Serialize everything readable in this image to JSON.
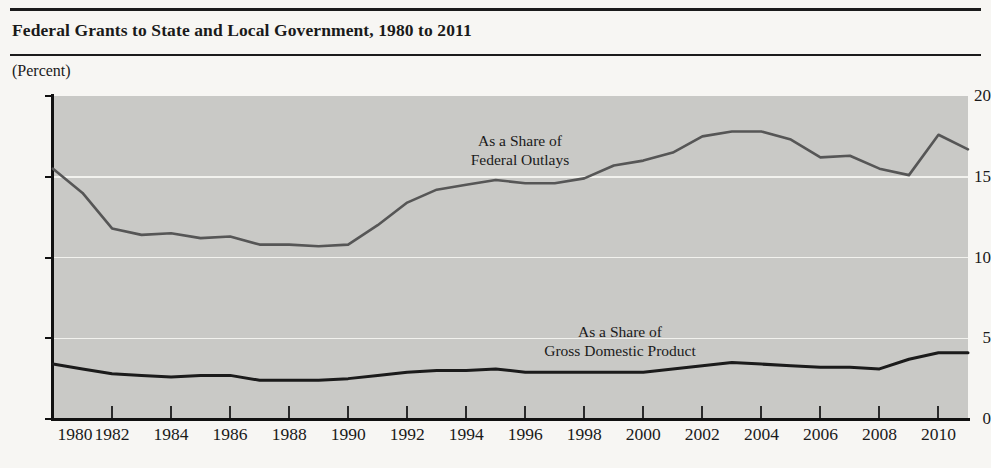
{
  "chart_title": "Federal Grants to State and Local Government, 1980 to 2011",
  "unit_label": "(Percent)",
  "colors": {
    "plot_background": "#c9c9c6",
    "page_background": "#f7f6f3",
    "gridline": "#f2f2ee",
    "axis": "#111111",
    "outlays_line": "#565656",
    "gdp_line": "#1b1b1b"
  },
  "axes": {
    "y_ticks": [
      "0",
      "5",
      "10",
      "15",
      "20"
    ],
    "y_min": 0,
    "y_max": 20,
    "x_ticks": [
      "1980",
      "1982",
      "1984",
      "1986",
      "1988",
      "1990",
      "1992",
      "1994",
      "1996",
      "1998",
      "2000",
      "2002",
      "2004",
      "2006",
      "2008",
      "2010"
    ],
    "x_min": 1980,
    "x_max": 2011
  },
  "annotations": [
    {
      "line1": "As a Share of",
      "line2": "Federal Outlays"
    },
    {
      "line1": "As a Share of",
      "line2": "Gross Domestic Product"
    }
  ],
  "chart_data": {
    "type": "line",
    "title": "Federal Grants to State and Local Government, 1980 to 2011",
    "xlabel": "",
    "ylabel": "(Percent)",
    "ylim": [
      0,
      20
    ],
    "xlim": [
      1980,
      2011
    ],
    "grid": true,
    "legend": "inline-annotations",
    "x": [
      1980,
      1981,
      1982,
      1983,
      1984,
      1985,
      1986,
      1987,
      1988,
      1989,
      1990,
      1991,
      1992,
      1993,
      1994,
      1995,
      1996,
      1997,
      1998,
      1999,
      2000,
      2001,
      2002,
      2003,
      2004,
      2005,
      2006,
      2007,
      2008,
      2009,
      2010,
      2011
    ],
    "series": [
      {
        "name": "As a Share of Federal Outlays",
        "color": "#565656",
        "values": [
          15.5,
          14.0,
          11.8,
          11.4,
          11.5,
          11.2,
          11.3,
          10.8,
          10.8,
          10.7,
          10.8,
          12.0,
          13.4,
          14.2,
          14.5,
          14.8,
          14.6,
          14.6,
          14.9,
          15.7,
          16.0,
          16.5,
          17.5,
          17.8,
          17.8,
          17.3,
          16.2,
          16.3,
          15.5,
          15.1,
          17.6,
          16.7
        ],
        "units": "percent"
      },
      {
        "name": "As a Share of Gross Domestic Product",
        "color": "#1b1b1b",
        "values": [
          3.4,
          3.1,
          2.8,
          2.7,
          2.6,
          2.7,
          2.7,
          2.4,
          2.4,
          2.4,
          2.5,
          2.7,
          2.9,
          3.0,
          3.0,
          3.1,
          2.9,
          2.9,
          2.9,
          2.9,
          2.9,
          3.1,
          3.3,
          3.5,
          3.4,
          3.3,
          3.2,
          3.2,
          3.1,
          3.7,
          4.1,
          4.1
        ],
        "units": "percent"
      }
    ]
  }
}
